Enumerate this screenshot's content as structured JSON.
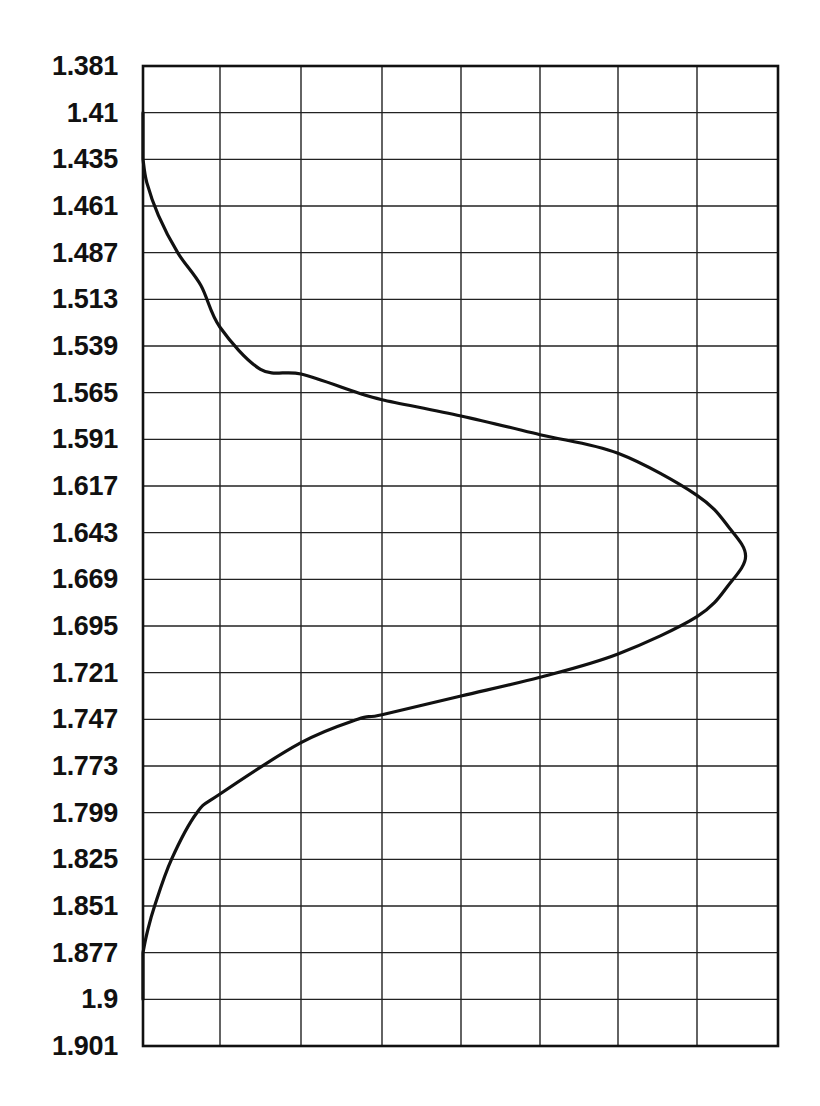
{
  "chart_data": {
    "type": "line",
    "title": "",
    "xlabel": "",
    "ylabel": "",
    "orientation": "y-axis-inverted (values increase downward)",
    "y_tick_labels": [
      "1.381",
      "1.41",
      "1.435",
      "1.461",
      "1.487",
      "1.513",
      "1.539",
      "1.565",
      "1.591",
      "1.617",
      "1.643",
      "1.669",
      "1.695",
      "1.721",
      "1.747",
      "1.773",
      "1.799",
      "1.825",
      "1.851",
      "1.877",
      "1.9",
      "1.901"
    ],
    "x_tick_labels": [],
    "x_grid_columns": 8,
    "y_grid_rows": 21,
    "grid": true,
    "legend": null,
    "xlim": [
      0,
      8
    ],
    "series": [
      {
        "name": "profile curve",
        "color": "#111111",
        "description": "bell-shaped profile peaking near y=1.68, x≈7.6 of 8 grid units; curve hugs left axis at top (above 1.435) and bottom (below 1.877)",
        "points_grid_units": [
          {
            "x": 0.0,
            "row": 2.0
          },
          {
            "x": 0.05,
            "row": 2.5
          },
          {
            "x": 0.2,
            "row": 3.2
          },
          {
            "x": 0.45,
            "row": 4.0
          },
          {
            "x": 0.75,
            "row": 4.7
          },
          {
            "x": 1.0,
            "row": 5.6
          },
          {
            "x": 1.5,
            "row": 6.5
          },
          {
            "x": 2.0,
            "row": 6.6
          },
          {
            "x": 2.7,
            "row": 7.0
          },
          {
            "x": 3.0,
            "row": 7.15
          },
          {
            "x": 4.0,
            "row": 7.5
          },
          {
            "x": 5.0,
            "row": 7.9
          },
          {
            "x": 6.0,
            "row": 8.3
          },
          {
            "x": 7.0,
            "row": 9.2
          },
          {
            "x": 7.4,
            "row": 9.9
          },
          {
            "x": 7.6,
            "row": 10.5
          },
          {
            "x": 7.4,
            "row": 11.1
          },
          {
            "x": 7.0,
            "row": 11.8
          },
          {
            "x": 6.0,
            "row": 12.6
          },
          {
            "x": 5.0,
            "row": 13.1
          },
          {
            "x": 4.0,
            "row": 13.5
          },
          {
            "x": 3.0,
            "row": 13.9
          },
          {
            "x": 2.7,
            "row": 14.0
          },
          {
            "x": 2.0,
            "row": 14.5
          },
          {
            "x": 1.0,
            "row": 15.6
          },
          {
            "x": 0.7,
            "row": 16.0
          },
          {
            "x": 0.37,
            "row": 17.0
          },
          {
            "x": 0.15,
            "row": 18.0
          },
          {
            "x": 0.05,
            "row": 18.6
          },
          {
            "x": 0.0,
            "row": 19.0
          }
        ]
      }
    ]
  },
  "layout": {
    "plot_left": 143,
    "plot_top": 66,
    "plot_right": 778,
    "plot_bottom": 1046,
    "vertical_grid_x": [
      143,
      220,
      301,
      382,
      461,
      540,
      618,
      697,
      778
    ]
  },
  "colors": {
    "grid": "#222222",
    "frame": "#111111",
    "curve": "#111111",
    "background": "#ffffff"
  }
}
